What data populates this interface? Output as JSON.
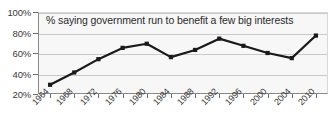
{
  "chart_data": {
    "type": "line",
    "title": "% saying government run to benefit a few big interests",
    "xlabel": "",
    "ylabel": "",
    "ylim": [
      20,
      100
    ],
    "yticks": [
      100,
      80,
      60,
      40,
      20
    ],
    "ytick_labels": [
      "100%",
      "80%",
      "60%",
      "40%",
      "20%"
    ],
    "grid": true,
    "legend": "none",
    "categories": [
      "1964",
      "1968",
      "1972",
      "1976",
      "1980",
      "1984",
      "1988",
      "1992",
      "1996",
      "2000",
      "2004",
      "2010"
    ],
    "values": [
      29,
      41,
      54,
      65,
      69,
      56,
      63,
      74,
      67,
      60,
      55,
      77
    ],
    "line_color": "#1a1a1a",
    "marker_color": "#1a1a1a",
    "plot_background": "#f7f7f7",
    "grid_color": "#c9c9c9"
  }
}
